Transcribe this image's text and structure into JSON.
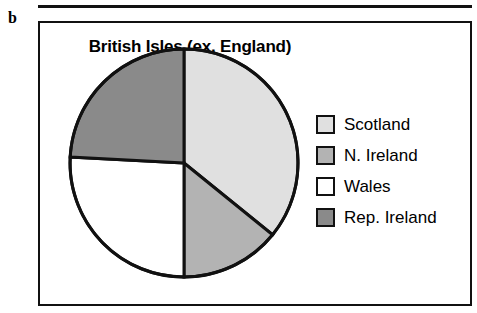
{
  "panel": {
    "label": "b"
  },
  "chart_data": {
    "type": "pie",
    "title": "British Isles (ex. England)",
    "xlabel": "",
    "ylabel": "",
    "legend_position": "right",
    "grid": false,
    "start_angle_deg": 0,
    "direction": "clockwise",
    "categories": [
      "Scotland",
      "N. Ireland",
      "Wales",
      "Rep. Ireland"
    ],
    "values": [
      36,
      14,
      26,
      24
    ],
    "units": "percent",
    "slices": [
      {
        "label": "Scotland",
        "value": 36,
        "start_angle_deg": 0,
        "end_angle_deg": 129,
        "color": "#e0e0e0"
      },
      {
        "label": "N. Ireland",
        "value": 14,
        "start_angle_deg": 129,
        "end_angle_deg": 180,
        "color": "#b3b3b3"
      },
      {
        "label": "Wales",
        "value": 26,
        "start_angle_deg": 180,
        "end_angle_deg": 273,
        "color": "#ffffff"
      },
      {
        "label": "Rep. Ireland",
        "value": 24,
        "start_angle_deg": 273,
        "end_angle_deg": 360,
        "color": "#8a8a8a"
      }
    ],
    "legend": [
      {
        "label": "Scotland",
        "color": "#e0e0e0"
      },
      {
        "label": "N. Ireland",
        "color": "#b3b3b3"
      },
      {
        "label": "Wales",
        "color": "#ffffff"
      },
      {
        "label": "Rep. Ireland",
        "color": "#8a8a8a"
      }
    ],
    "stroke_color": "#111111"
  }
}
